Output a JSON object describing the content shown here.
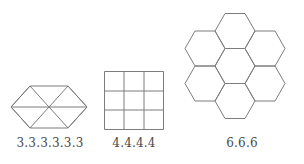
{
  "page": {
    "background_color": "#ffffff",
    "stroke_color": "#7d7d7d",
    "label_color": "#4a4a4a",
    "width": 304,
    "height": 164
  },
  "figures": [
    {
      "id": "triangles",
      "label": "3.3.3.3.3.3",
      "shape_name": "equilateral-triangle-tessellation",
      "tile_count": 6,
      "polygon_sides": 3,
      "outline": "regular hexagon outline subdivided into six equilateral triangles",
      "bounds": {
        "x": 11,
        "y": 86,
        "width": 76,
        "height": 42
      }
    },
    {
      "id": "squares",
      "label": "4.4.4.4",
      "shape_name": "square-tessellation",
      "tile_count": 9,
      "polygon_sides": 4,
      "outline": "3 by 3 grid of squares",
      "rows": 3,
      "columns": 3,
      "bounds": {
        "x": 104,
        "y": 71,
        "width": 60,
        "height": 59
      }
    },
    {
      "id": "hexagons",
      "label": "6.6.6",
      "shape_name": "regular-hexagon-tessellation",
      "tile_count": 7,
      "polygon_sides": 6,
      "outline": "one central hexagon surrounded by six hexagons forming a flower",
      "bounds": {
        "x": 182,
        "y": 4,
        "width": 106,
        "height": 124
      }
    }
  ]
}
